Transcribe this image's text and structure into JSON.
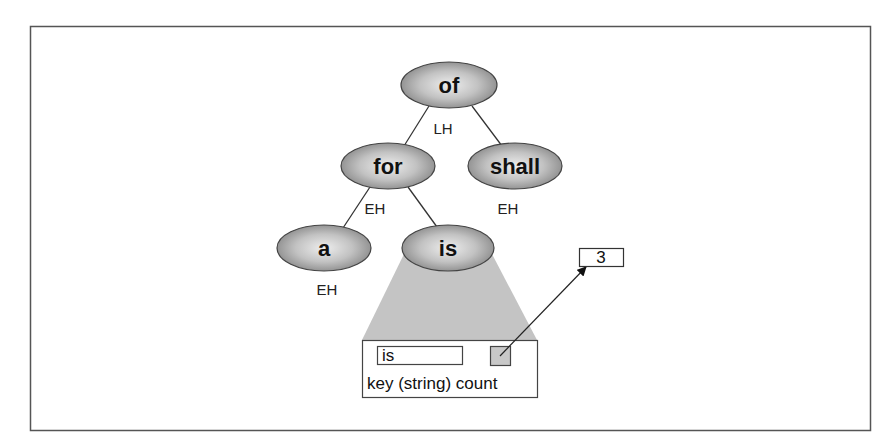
{
  "diagram": {
    "type": "avl-tree",
    "colors": {
      "frame": "#555555",
      "node_fill_center": "#e6e6e6",
      "node_fill_edge": "#8c8c8c",
      "node_stroke": "#444444",
      "edge": "#333333",
      "projection_fill": "#c4c4c4",
      "count_fill": "#c8c8c8"
    },
    "nodes": [
      {
        "id": "of",
        "label": "of",
        "balance": "LH",
        "cx": 449,
        "cy": 85
      },
      {
        "id": "for",
        "label": "for",
        "balance": "EH",
        "cx": 388,
        "cy": 166
      },
      {
        "id": "shall",
        "label": "shall",
        "balance": "EH",
        "cx": 515,
        "cy": 166
      },
      {
        "id": "a",
        "label": "a",
        "balance": "EH",
        "cx": 324,
        "cy": 248
      },
      {
        "id": "is",
        "label": "is",
        "balance": "",
        "cx": 448,
        "cy": 248
      }
    ],
    "edges": [
      [
        "of",
        "for"
      ],
      [
        "of",
        "shall"
      ],
      [
        "for",
        "a"
      ],
      [
        "for",
        "is"
      ]
    ],
    "record": {
      "key_value": "is",
      "caption": "key (string) count"
    },
    "count_value": "3"
  }
}
